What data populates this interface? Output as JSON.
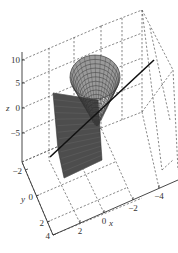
{
  "chart_data": {
    "type": "surface3d",
    "title": "",
    "xlabel": "x",
    "ylabel": "y",
    "zlabel": "z",
    "xlim": [
      -4,
      4
    ],
    "ylim": [
      -2,
      4
    ],
    "zlim": [
      -8,
      12
    ],
    "x_ticks": [
      {
        "value": 2,
        "label": "2"
      },
      {
        "value": 0,
        "label": "0"
      },
      {
        "value": -2,
        "label": "−2"
      },
      {
        "value": -4,
        "label": "−4"
      }
    ],
    "y_ticks": [
      {
        "value": -2,
        "label": "−2"
      },
      {
        "value": 0,
        "label": "0"
      },
      {
        "value": 2,
        "label": "2"
      },
      {
        "value": 4,
        "label": "4"
      }
    ],
    "z_ticks": [
      {
        "value": 10,
        "label": "10"
      },
      {
        "value": 5,
        "label": "5"
      },
      {
        "value": 0,
        "label": "0"
      },
      {
        "value": -5,
        "label": "−5"
      }
    ],
    "grid": true,
    "box": true,
    "series": [
      {
        "name": "cone-surface",
        "kind": "mesh",
        "description": "half-cone / paraboloid opening upward-right, apex near origin",
        "color": "#333333"
      },
      {
        "name": "plane",
        "kind": "surface",
        "description": "tilted planar patch through origin",
        "color": "#4a4a4a"
      },
      {
        "name": "axis-line",
        "kind": "line",
        "description": "straight line through origin",
        "color": "#111111"
      }
    ]
  }
}
